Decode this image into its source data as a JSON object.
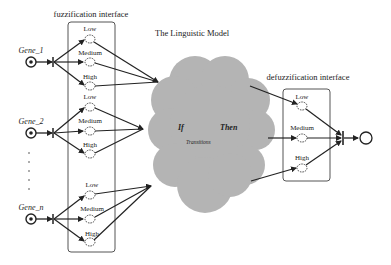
{
  "diagram": {
    "fuzzification_label": "fuzzification interface",
    "defuzzification_label": "defuzzification interface",
    "model_label": "The Linguistic Model",
    "cloud": {
      "if_label": "If",
      "then_label": "Then",
      "transitions_label": "Transitions",
      "fill": "#b4b4b4"
    },
    "genes": [
      {
        "label": "Gene_1",
        "levels": [
          "Low",
          "Medium",
          "High"
        ]
      },
      {
        "label": "Gene_2",
        "levels": [
          "Low",
          "Medium",
          "High"
        ]
      },
      {
        "label": "Gene_n",
        "levels": [
          "Low",
          "Medium",
          "High"
        ]
      }
    ],
    "ellipsis": "· · · · ·",
    "output_levels": [
      "Low",
      "Medium",
      "High"
    ],
    "colors": {
      "line": "#222222",
      "box": "#555555",
      "background": "#ffffff"
    }
  }
}
